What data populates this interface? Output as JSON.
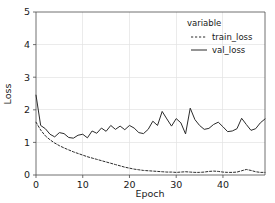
{
  "chart_data": {
    "type": "line",
    "title": "",
    "xlabel": "Epoch",
    "ylabel": "Loss",
    "xlim": [
      0,
      49
    ],
    "ylim": [
      0,
      5
    ],
    "xticks": [
      0,
      10,
      20,
      30,
      40
    ],
    "xtick_labels": [
      "0",
      "10",
      "20",
      "30",
      "40"
    ],
    "yticks": [
      0,
      1,
      2,
      3,
      4,
      5
    ],
    "ytick_labels": [
      "0",
      "1",
      "2",
      "3",
      "4",
      "5"
    ],
    "grid": true,
    "legend_position": "top-right",
    "legend_title": "variable",
    "series": [
      {
        "name": "train_loss",
        "style": "dashed",
        "color": "#2b2b2b",
        "x": [
          0,
          1,
          2,
          3,
          4,
          5,
          6,
          7,
          8,
          9,
          10,
          11,
          12,
          13,
          14,
          15,
          16,
          17,
          18,
          19,
          20,
          21,
          22,
          23,
          24,
          25,
          26,
          27,
          28,
          29,
          30,
          31,
          32,
          33,
          34,
          35,
          36,
          37,
          38,
          39,
          40,
          41,
          42,
          43,
          44,
          45,
          46,
          47,
          48,
          49
        ],
        "values": [
          1.62,
          1.38,
          1.2,
          1.08,
          0.98,
          0.9,
          0.83,
          0.77,
          0.71,
          0.66,
          0.61,
          0.56,
          0.52,
          0.48,
          0.44,
          0.4,
          0.36,
          0.32,
          0.28,
          0.24,
          0.21,
          0.18,
          0.16,
          0.14,
          0.13,
          0.12,
          0.11,
          0.1,
          0.09,
          0.09,
          0.08,
          0.09,
          0.1,
          0.09,
          0.08,
          0.08,
          0.09,
          0.11,
          0.12,
          0.11,
          0.09,
          0.08,
          0.08,
          0.09,
          0.13,
          0.17,
          0.14,
          0.1,
          0.08,
          0.08
        ]
      },
      {
        "name": "val_loss",
        "style": "solid",
        "color": "#2b2b2b",
        "x": [
          0,
          1,
          2,
          3,
          4,
          5,
          6,
          7,
          8,
          9,
          10,
          11,
          12,
          13,
          14,
          15,
          16,
          17,
          18,
          19,
          20,
          21,
          22,
          23,
          24,
          25,
          26,
          27,
          28,
          29,
          30,
          31,
          32,
          33,
          34,
          35,
          36,
          37,
          38,
          39,
          40,
          41,
          42,
          43,
          44,
          45,
          46,
          47,
          48,
          49
        ],
        "values": [
          2.45,
          1.52,
          1.42,
          1.25,
          1.17,
          1.3,
          1.27,
          1.15,
          1.13,
          1.22,
          1.25,
          1.14,
          1.35,
          1.28,
          1.44,
          1.34,
          1.52,
          1.4,
          1.5,
          1.39,
          1.52,
          1.44,
          1.3,
          1.27,
          1.4,
          1.65,
          1.52,
          1.95,
          1.72,
          1.5,
          1.73,
          1.6,
          1.26,
          2.05,
          1.7,
          1.52,
          1.4,
          1.43,
          1.55,
          1.62,
          1.48,
          1.33,
          1.35,
          1.42,
          1.74,
          1.55,
          1.37,
          1.42,
          1.6,
          1.72
        ]
      }
    ]
  }
}
